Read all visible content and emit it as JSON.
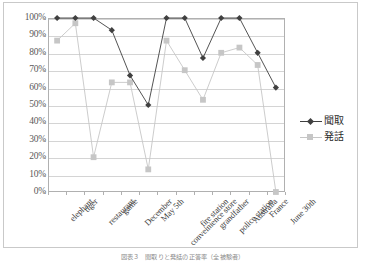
{
  "chart_data": {
    "type": "line",
    "title": "",
    "xlabel": "",
    "ylabel": "",
    "ylim": [
      0,
      100
    ],
    "ytick_labels": [
      "100%",
      "90%",
      "80%",
      "70%",
      "60%",
      "50%",
      "40%",
      "30%",
      "20%",
      "10%",
      "0%"
    ],
    "ytick_values": [
      100,
      90,
      80,
      70,
      60,
      50,
      40,
      30,
      20,
      10,
      0
    ],
    "grid": true,
    "legend_position": "right",
    "categories": [
      "elephant",
      "tiger",
      "restaurant",
      "game",
      "December",
      "May 5th",
      "conveinience store",
      "fire station",
      "grandfather",
      "police station",
      "Australia",
      "France",
      "June 30th"
    ],
    "series": [
      {
        "name": "聞取",
        "marker": "diamond",
        "color": "#404040",
        "values": [
          100,
          100,
          100,
          93,
          67,
          50,
          100,
          100,
          77,
          100,
          100,
          80,
          60
        ]
      },
      {
        "name": "発話",
        "marker": "square",
        "color": "#c6c6c6",
        "values": [
          87,
          97,
          20,
          63,
          63,
          13,
          87,
          70,
          53,
          80,
          83,
          73,
          0
        ]
      }
    ]
  },
  "legend": {
    "items": [
      {
        "label": "聞取",
        "color": "#404040",
        "marker": "diamond"
      },
      {
        "label": "発話",
        "color": "#c6c6c6",
        "marker": "square"
      }
    ]
  },
  "caption": {
    "text": "図表３　聞取りと発話の正答率（全被験者）"
  }
}
